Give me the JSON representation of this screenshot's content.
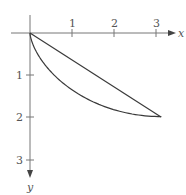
{
  "diagram": {
    "type": "brachistochrone",
    "colors": {
      "axes": "#777777",
      "curves": "#3a3a3a",
      "text": "#555555"
    },
    "axes": {
      "x_label": "x",
      "y_label": "y",
      "x_ticks": [
        "1",
        "2",
        "3"
      ],
      "y_ticks": [
        "1",
        "2",
        "3"
      ]
    },
    "curves": [
      {
        "name": "straight-line",
        "from": [
          0,
          0
        ],
        "to": [
          3.1416,
          2
        ]
      },
      {
        "name": "cycloid",
        "param": "x = t - sin t, y = 1 - cos t",
        "t_range": [
          0,
          3.1416
        ]
      }
    ]
  }
}
